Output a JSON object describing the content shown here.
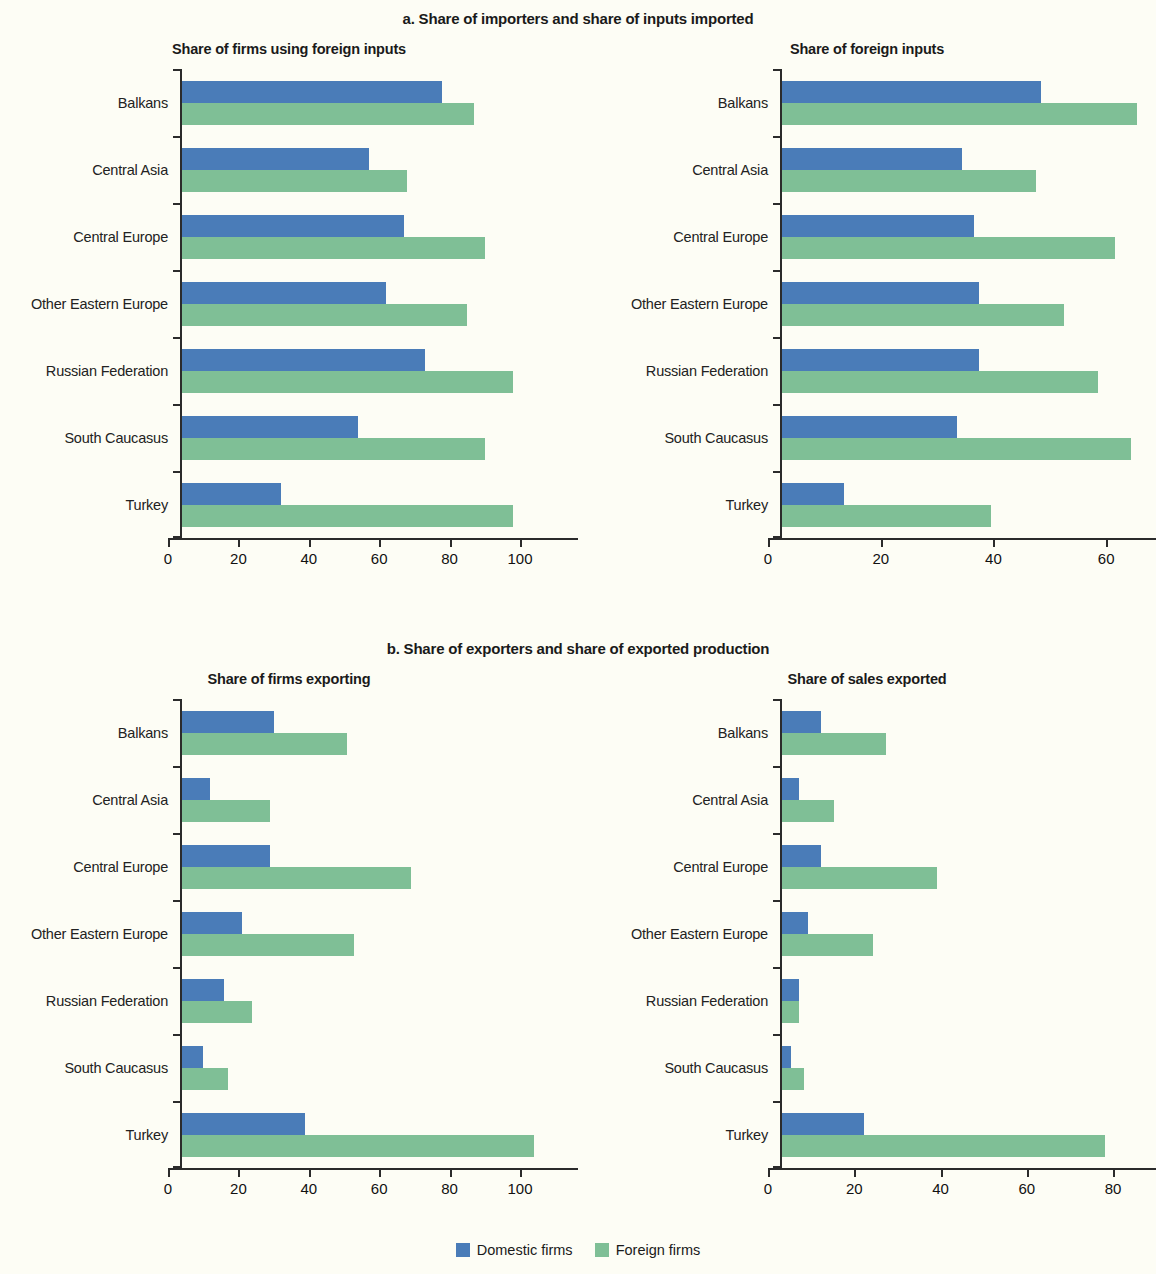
{
  "colors": {
    "domestic": "#4a7cb8",
    "foreign": "#7fbf96",
    "background": "#fdfdf5",
    "axis": "#2b2b2b"
  },
  "panels": [
    {
      "title": "a. Share of importers and share of inputs imported"
    },
    {
      "title": "b. Share of exporters and share of exported production"
    }
  ],
  "legend": {
    "items": [
      {
        "label": "Domestic firms",
        "icon": "blue-square-swatch"
      },
      {
        "label": "Foreign firms",
        "icon": "green-square-swatch"
      }
    ]
  },
  "chart_data": [
    {
      "type": "bar",
      "orientation": "horizontal",
      "title": "Share of firms using foreign inputs",
      "panel": "a. Share of importers and share of inputs imported",
      "xlabel": "",
      "ylabel": "",
      "xlim": [
        0,
        100
      ],
      "xticks": [
        0,
        20,
        40,
        60,
        80,
        100
      ],
      "grid": false,
      "legend_position": "bottom-center",
      "categories": [
        "Balkans",
        "Central Asia",
        "Central Europe",
        "Other Eastern Europe",
        "Russian Federation",
        "South Caucasus",
        "Turkey"
      ],
      "series": [
        {
          "name": "Domestic firms",
          "color": "#4a7cb8",
          "values": [
            74,
            53,
            63,
            58,
            69,
            50,
            28
          ]
        },
        {
          "name": "Foreign firms",
          "color": "#7fbf96",
          "values": [
            83,
            64,
            86,
            81,
            94,
            86,
            94
          ]
        }
      ]
    },
    {
      "type": "bar",
      "orientation": "horizontal",
      "title": "Share of foreign inputs",
      "panel": "a. Share of importers and share of inputs imported",
      "xlabel": "",
      "ylabel": "",
      "xlim": [
        0,
        66
      ],
      "xticks": [
        0,
        20,
        40,
        60
      ],
      "grid": false,
      "legend_position": "bottom-center",
      "categories": [
        "Balkans",
        "Central Asia",
        "Central Europe",
        "Other Eastern Europe",
        "Russian Federation",
        "South Caucasus",
        "Turkey"
      ],
      "series": [
        {
          "name": "Domestic firms",
          "color": "#4a7cb8",
          "values": [
            46,
            32,
            34,
            35,
            35,
            31,
            11
          ]
        },
        {
          "name": "Foreign firms",
          "color": "#7fbf96",
          "values": [
            63,
            45,
            59,
            50,
            56,
            62,
            37
          ]
        }
      ]
    },
    {
      "type": "bar",
      "orientation": "horizontal",
      "title": "Share of firms exporting",
      "panel": "b. Share of exporters and share of exported production",
      "xlabel": "",
      "ylabel": "",
      "xlim": [
        0,
        100
      ],
      "xticks": [
        0,
        20,
        40,
        60,
        80,
        100
      ],
      "grid": false,
      "legend_position": "bottom-center",
      "categories": [
        "Balkans",
        "Central Asia",
        "Central Europe",
        "Other Eastern Europe",
        "Russian Federation",
        "South Caucasus",
        "Turkey"
      ],
      "series": [
        {
          "name": "Domestic firms",
          "color": "#4a7cb8",
          "values": [
            26,
            8,
            25,
            17,
            12,
            6,
            35
          ]
        },
        {
          "name": "Foreign firms",
          "color": "#7fbf96",
          "values": [
            47,
            25,
            65,
            49,
            20,
            13,
            100
          ]
        }
      ]
    },
    {
      "type": "bar",
      "orientation": "horizontal",
      "title": "Share of sales exported",
      "panel": "b. Share of exporters and share of exported production",
      "xlabel": "",
      "ylabel": "",
      "xlim": [
        0,
        80
      ],
      "xticks": [
        0,
        20,
        40,
        60,
        80
      ],
      "grid": false,
      "legend_position": "bottom-center",
      "categories": [
        "Balkans",
        "Central Asia",
        "Central Europe",
        "Other Eastern Europe",
        "Russian Federation",
        "South Caucasus",
        "Turkey"
      ],
      "series": [
        {
          "name": "Domestic firms",
          "color": "#4a7cb8",
          "values": [
            9,
            4,
            9,
            6,
            4,
            2,
            19
          ]
        },
        {
          "name": "Foreign firms",
          "color": "#7fbf96",
          "values": [
            24,
            12,
            36,
            21,
            4,
            5,
            75
          ]
        }
      ]
    }
  ]
}
